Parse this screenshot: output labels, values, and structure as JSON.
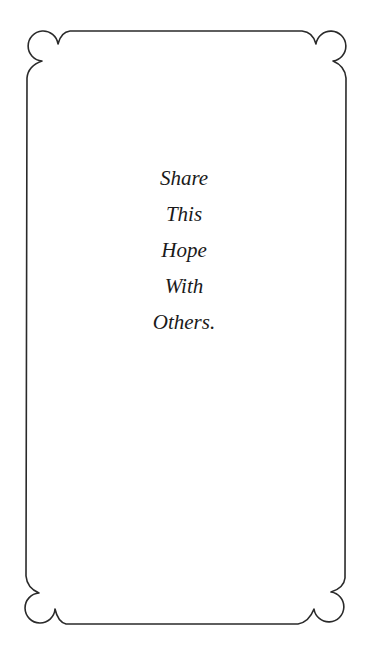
{
  "card": {
    "border_color": "#2a2a2a",
    "background": "#ffffff",
    "message_lines": [
      "Share",
      "This",
      "Hope",
      "With",
      "Others."
    ]
  }
}
